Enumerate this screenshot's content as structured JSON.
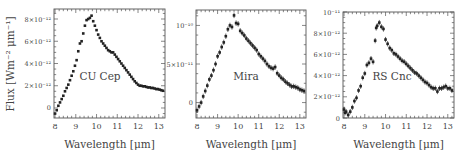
{
  "figure": {
    "ylabel": "Flux [Wm⁻² μm⁻¹]",
    "xlabel": "Wavelength [μm]"
  },
  "chart_data": [
    {
      "type": "scatter",
      "title": "CU Cep",
      "xlabel": "Wavelength [μm]",
      "ylabel": "Flux [Wm^-2 μm^-1]",
      "xlim": [
        7.95,
        13.3
      ],
      "ylim": [
        -9e-13,
        8.9e-12
      ],
      "xticks": [
        8,
        9,
        10,
        11,
        12,
        13
      ],
      "yticks": [
        0,
        2e-12,
        4e-12,
        6e-12,
        8e-12
      ],
      "ytick_labels": [
        "0",
        "2×10⁻¹²",
        "4×10⁻¹²",
        "6×10⁻¹²",
        "8×10⁻¹²"
      ],
      "error_bars": false,
      "x": [
        8.0,
        8.08,
        8.16,
        8.24,
        8.32,
        8.4,
        8.48,
        8.56,
        8.64,
        8.72,
        8.8,
        8.88,
        8.96,
        9.04,
        9.12,
        9.2,
        9.28,
        9.36,
        9.44,
        9.52,
        9.6,
        9.68,
        9.76,
        9.84,
        9.92,
        10.0,
        10.08,
        10.16,
        10.24,
        10.32,
        10.4,
        10.48,
        10.56,
        10.64,
        10.72,
        10.8,
        10.88,
        10.96,
        11.04,
        11.12,
        11.2,
        11.28,
        11.36,
        11.44,
        11.52,
        11.6,
        11.68,
        11.76,
        11.84,
        11.92,
        12.0,
        12.08,
        12.16,
        12.24,
        12.32,
        12.4,
        12.48,
        12.56,
        12.64,
        12.72,
        12.8,
        12.88,
        12.96,
        13.04,
        13.12,
        13.2
      ],
      "values": [
        -5e-13,
        -2e-13,
        2e-13,
        5e-13,
        8e-13,
        1.1e-12,
        1.5e-12,
        1.8e-12,
        2.1e-12,
        2.5e-12,
        2.9e-12,
        3.3e-12,
        3.8e-12,
        4.3e-12,
        5.1e-12,
        5.8e-12,
        6e-12,
        6.7e-12,
        7.4e-12,
        7.9e-12,
        8e-12,
        8.1e-12,
        8.3e-12,
        7.8e-12,
        7.4e-12,
        7e-12,
        6.6e-12,
        6.3e-12,
        6e-12,
        5.8e-12,
        5.6e-12,
        5.4e-12,
        5.2e-12,
        5.1e-12,
        5e-12,
        5e-12,
        4.8e-12,
        4.6e-12,
        4.4e-12,
        4.2e-12,
        4e-12,
        3.8e-12,
        3.6e-12,
        3.4e-12,
        3.2e-12,
        3e-12,
        2.8e-12,
        2.6e-12,
        2.4e-12,
        2.25e-12,
        2.1e-12,
        2e-12,
        2e-12,
        1.95e-12,
        1.95e-12,
        1.9e-12,
        1.85e-12,
        1.85e-12,
        1.8e-12,
        1.8e-12,
        1.75e-12,
        1.7e-12,
        1.7e-12,
        1.65e-12,
        1.6e-12,
        1.55e-12
      ],
      "annotation": "CU Cep"
    },
    {
      "type": "scatter",
      "title": "Mira",
      "xlabel": "Wavelength [μm]",
      "ylabel": "",
      "xlim": [
        7.95,
        13.3
      ],
      "ylim": [
        -2e-11,
        1.2e-10
      ],
      "xticks": [
        8,
        9,
        10,
        11,
        12,
        13
      ],
      "yticks": [
        0,
        5e-11,
        1e-10
      ],
      "ytick_labels": [
        "0",
        "5×10⁻¹¹",
        "10⁻¹⁰"
      ],
      "error_bars": true,
      "x": [
        8.0,
        8.1,
        8.2,
        8.3,
        8.4,
        8.5,
        8.6,
        8.7,
        8.8,
        8.9,
        9.0,
        9.1,
        9.2,
        9.3,
        9.4,
        9.5,
        9.6,
        9.7,
        9.8,
        9.9,
        10.0,
        10.1,
        10.2,
        10.3,
        10.4,
        10.5,
        10.6,
        10.7,
        10.8,
        10.9,
        11.0,
        11.1,
        11.2,
        11.3,
        11.4,
        11.5,
        11.6,
        11.7,
        11.8,
        11.9,
        12.0,
        12.1,
        12.2,
        12.3,
        12.4,
        12.5,
        12.6,
        12.7,
        12.8,
        12.9,
        13.0,
        13.1,
        13.2
      ],
      "values": [
        -1e-11,
        -5e-12,
        0.0,
        8e-12,
        1.5e-11,
        2.2e-11,
        3e-11,
        3.5e-11,
        4.2e-11,
        5e-11,
        6e-11,
        6.5e-11,
        7.2e-11,
        7.8e-11,
        8.6e-11,
        9.5e-11,
        1e-10,
        9.8e-11,
        1.13e-10,
        1.03e-10,
        1.02e-10,
        9.3e-11,
        9e-11,
        8.7e-11,
        8.3e-11,
        8e-11,
        7.7e-11,
        7.4e-11,
        7.1e-11,
        6.8e-11,
        6.3e-11,
        6e-11,
        5.7e-11,
        5.4e-11,
        5e-11,
        4.7e-11,
        4.5e-11,
        4.4e-11,
        4.6e-11,
        3.8e-11,
        3.5e-11,
        3.2e-11,
        3e-11,
        2.7e-11,
        2.5e-11,
        2.3e-11,
        2.1e-11,
        2.1e-11,
        2e-11,
        1.9e-11,
        1.7e-11,
        1.6e-11,
        1.5e-11
      ],
      "annotation": "Mira"
    },
    {
      "type": "scatter",
      "title": "RS Cnc",
      "xlabel": "Wavelength [μm]",
      "ylabel": "",
      "xlim": [
        7.95,
        13.3
      ],
      "ylim": [
        0,
        1e-11
      ],
      "xticks": [
        8,
        9,
        10,
        11,
        12,
        13
      ],
      "yticks": [
        0,
        2e-12,
        4e-12,
        6e-12,
        8e-12,
        1e-11
      ],
      "ytick_labels": [
        "0",
        "2×10⁻¹²",
        "4×10⁻¹²",
        "6×10⁻¹²",
        "8×10⁻¹²",
        "10⁻¹¹"
      ],
      "error_bars": true,
      "x": [
        8.0,
        8.05,
        8.1,
        8.2,
        8.3,
        8.4,
        8.5,
        8.6,
        8.7,
        8.8,
        8.9,
        9.0,
        9.1,
        9.2,
        9.3,
        9.4,
        9.5,
        9.55,
        9.6,
        9.7,
        9.8,
        9.9,
        10.0,
        10.1,
        10.2,
        10.3,
        10.4,
        10.5,
        10.6,
        10.7,
        10.8,
        10.9,
        11.0,
        11.1,
        11.2,
        11.3,
        11.4,
        11.5,
        11.6,
        11.7,
        11.8,
        11.9,
        12.0,
        12.1,
        12.2,
        12.3,
        12.4,
        12.5,
        12.6,
        12.7,
        12.8,
        12.9,
        13.0,
        13.1,
        13.2
      ],
      "values": [
        8e-13,
        5e-13,
        6e-13,
        3e-13,
        6e-13,
        1e-12,
        1.6e-12,
        1.9e-12,
        2.6e-12,
        3e-12,
        3.8e-12,
        4.2e-12,
        5e-12,
        5.2e-12,
        5.6e-12,
        5.3e-12,
        7.3e-12,
        8.5e-12,
        8.7e-12,
        9e-12,
        8.6e-12,
        8.4e-12,
        7.4e-12,
        7e-12,
        6.6e-12,
        6.4e-12,
        6.1e-12,
        6e-12,
        5.8e-12,
        5.6e-12,
        5.4e-12,
        5.3e-12,
        5.1e-12,
        4.9e-12,
        4.7e-12,
        4.5e-12,
        4.3e-12,
        4.2e-12,
        4e-12,
        3.8e-12,
        3.6e-12,
        3.4e-12,
        3.3e-12,
        3.1e-12,
        2.9e-12,
        2.8e-12,
        2.8e-12,
        2.5e-12,
        2.8e-12,
        2.8e-12,
        2.9e-12,
        3e-12,
        2.8e-12,
        2.8e-12,
        2.6e-12
      ],
      "annotation": "RS Cnc"
    }
  ]
}
